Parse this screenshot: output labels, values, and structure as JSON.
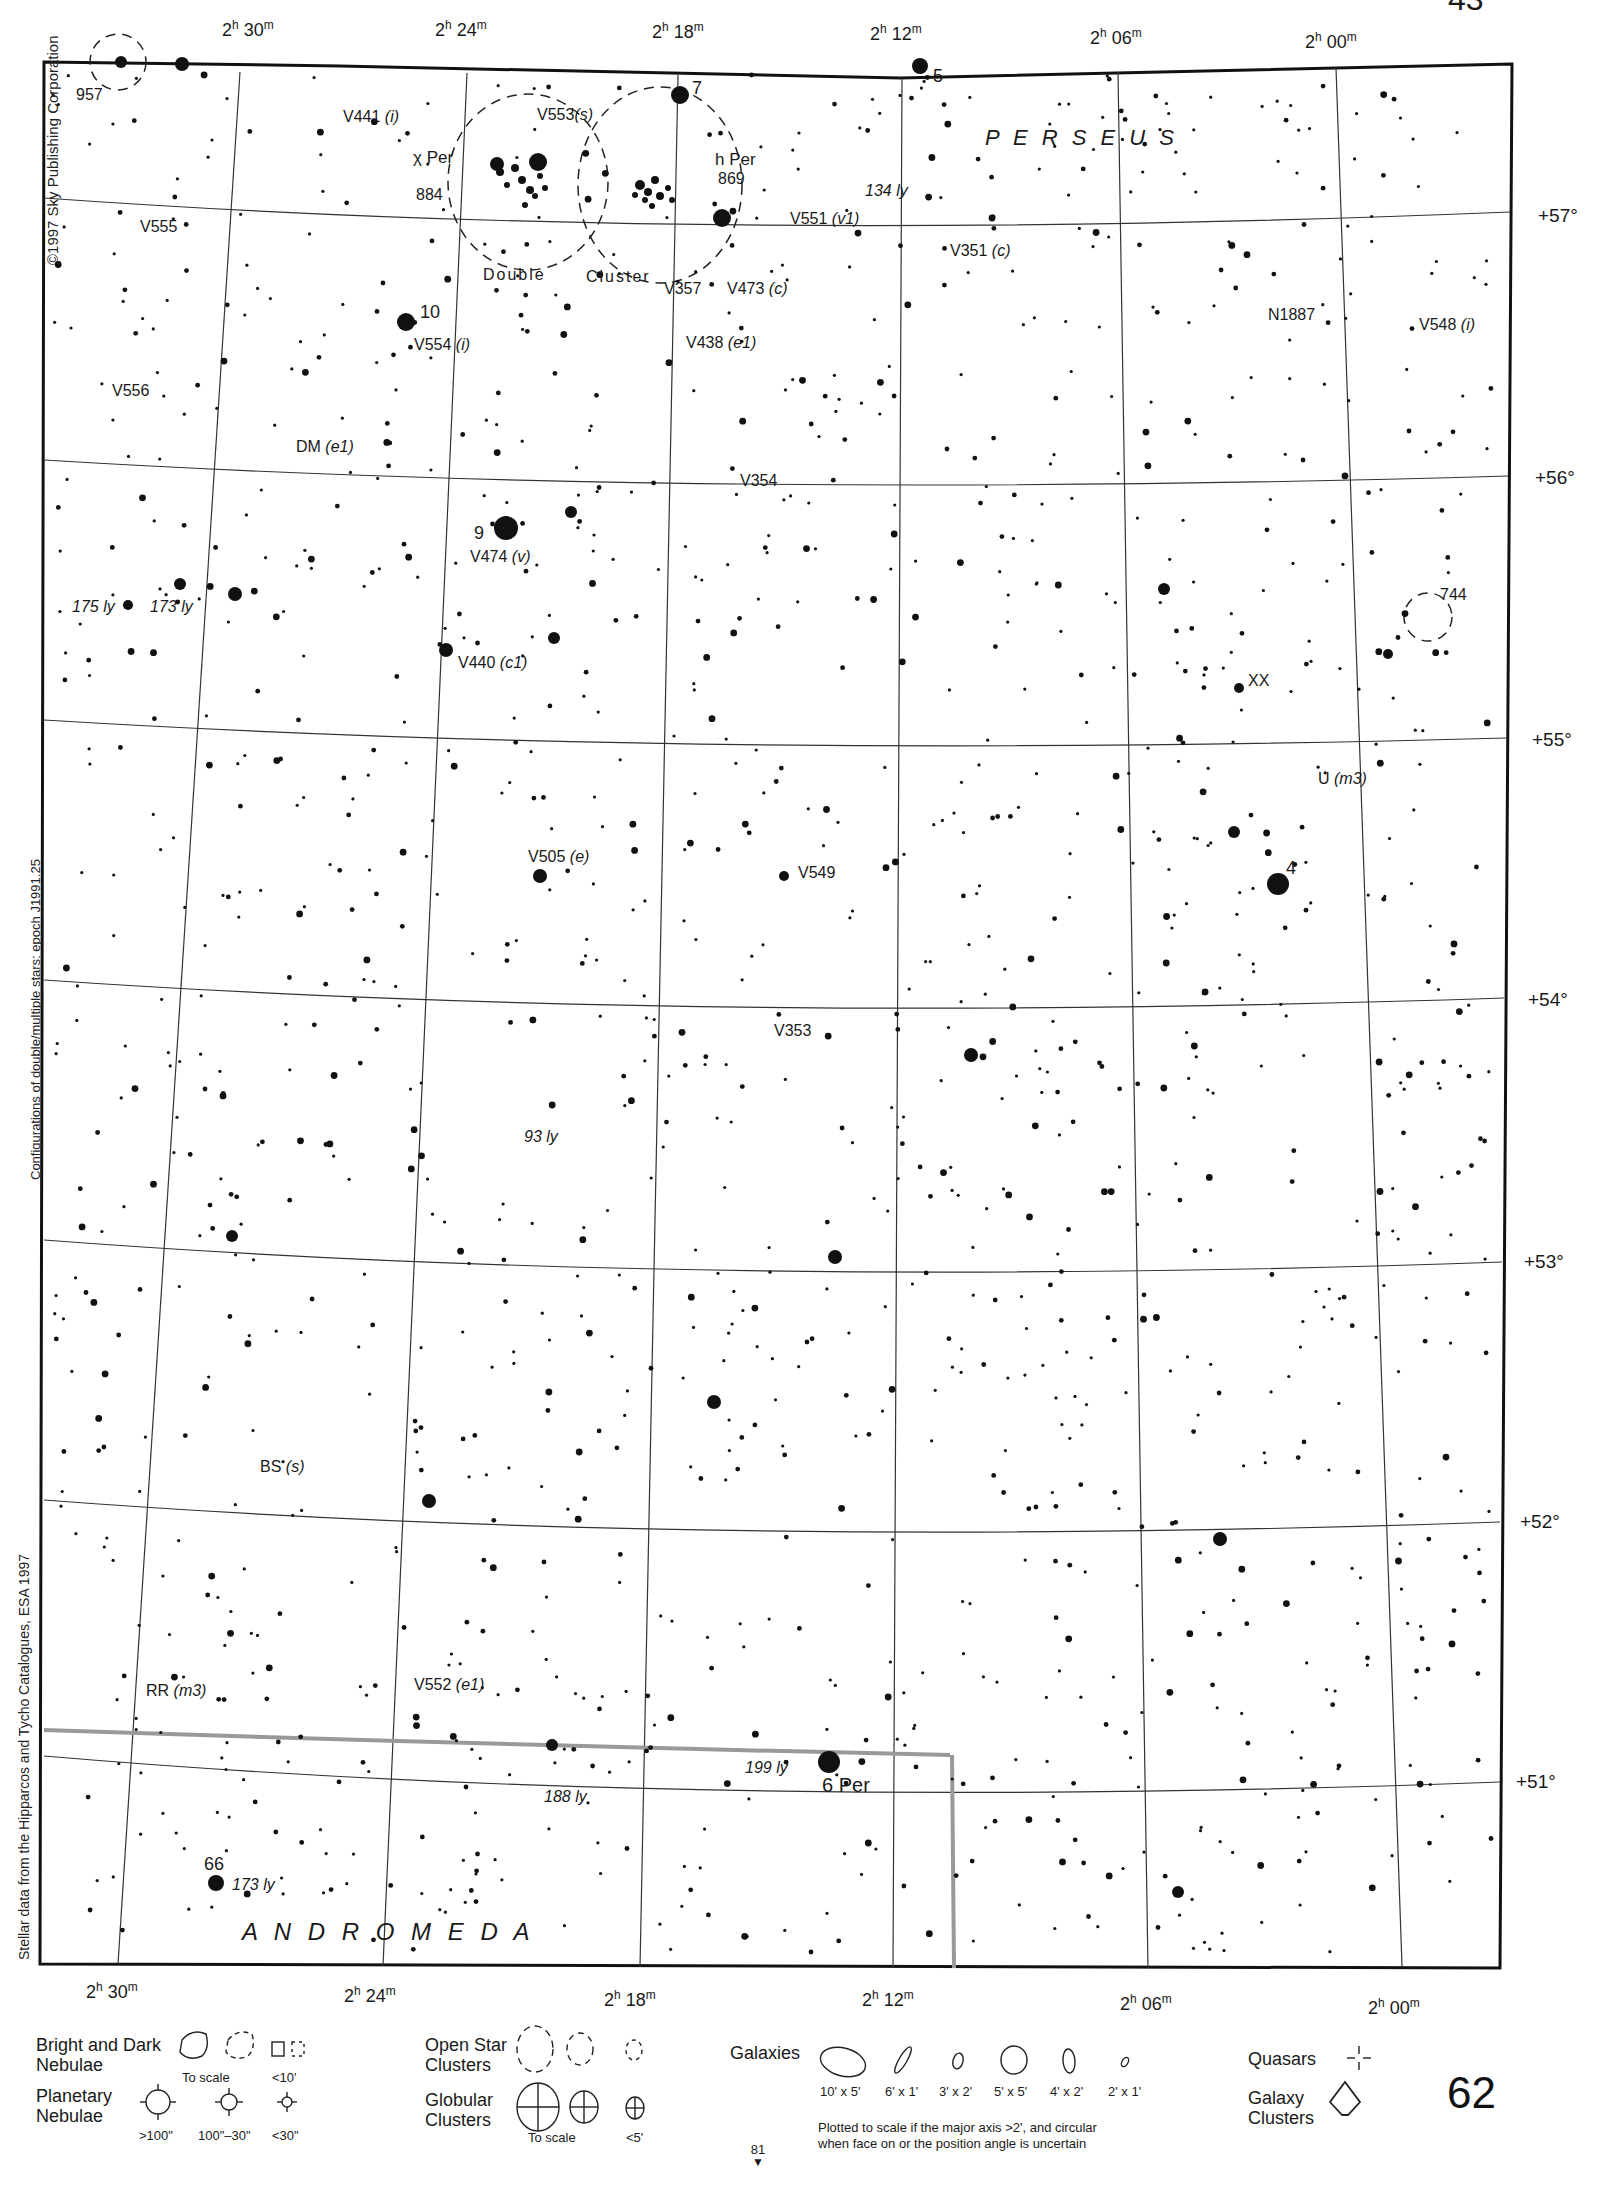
{
  "chart_title": "Sky Atlas Chart 62 — Perseus / Andromeda",
  "page": {
    "number": "62",
    "next_page_below": "81",
    "top_right_partial": "43"
  },
  "credits": {
    "copyright": "©1997 Sky Publishing Corporation",
    "epoch_note": "Configurations of double/multiple stars: epoch J1991.25",
    "data_source": "Stellar data from the Hipparcos and Tycho Catalogues, ESA 1997"
  },
  "axes": {
    "ra_top": [
      {
        "h": "2",
        "m": "30"
      },
      {
        "h": "2",
        "m": "24"
      },
      {
        "h": "2",
        "m": "18"
      },
      {
        "h": "2",
        "m": "12"
      },
      {
        "h": "2",
        "m": "06"
      },
      {
        "h": "2",
        "m": "00"
      }
    ],
    "ra_bottom": [
      {
        "h": "2",
        "m": "30"
      },
      {
        "h": "2",
        "m": "24"
      },
      {
        "h": "2",
        "m": "18"
      },
      {
        "h": "2",
        "m": "12"
      },
      {
        "h": "2",
        "m": "06"
      },
      {
        "h": "2",
        "m": "00"
      }
    ],
    "dec": [
      "+57°",
      "+56°",
      "+55°",
      "+54°",
      "+53°",
      "+52°",
      "+51°"
    ],
    "ra_unit_h": "h",
    "ra_unit_m": "m"
  },
  "constellations": [
    "P E R S E U S",
    "A N D R O M E D A"
  ],
  "labels": {
    "l957": "957",
    "l7": "7",
    "l5": "5",
    "v441": "V441",
    "v441_t": "(i)",
    "v553": "V553",
    "v553_t": "(s)",
    "chi_per": "χ Per",
    "n884": "884",
    "h_per": "h Per",
    "n869": "869",
    "double": "Double",
    "cluster": "Cluster",
    "ly134": "134 ly",
    "v551": "V551",
    "v551_t": "(v1)",
    "v351": "V351",
    "v351_t": "(c)",
    "v555": "V555",
    "l10": "10",
    "v554": "V554",
    "v554_t": "(i)",
    "v357": "V357",
    "v473": "V473",
    "v473_t": "(c)",
    "v438": "V438",
    "v438_t": "(e1)",
    "n1887": "N1887",
    "v548": "V548",
    "v548_t": "(i)",
    "v556": "V556",
    "dm": "DM",
    "dm_t": "(e1)",
    "v354": "V354",
    "l9": "9",
    "v474": "V474",
    "v474_t": "(v)",
    "ly175": "175 ly",
    "ly173a": "173 ly",
    "n744": "744",
    "v440": "V440",
    "v440_t": "(c1)",
    "xx": "XX",
    "u": "U",
    "u_t": "(m3)",
    "v505": "V505",
    "v505_t": "(e)",
    "v549": "V549",
    "l4": "4",
    "v353": "V353",
    "ly93": "93 ly",
    "bs": "BS",
    "bs_t": "(s)",
    "rr": "RR",
    "rr_t": "(m3)",
    "v552": "V552",
    "v552_t": "(e1)",
    "ly199": "199 ly",
    "six_per": "6 Per",
    "ly188": "188 ly",
    "l66": "66",
    "ly173b": "173 ly"
  },
  "legend": {
    "nebulae_label": "Bright and Dark Nebulae",
    "nebulae_scale": "To scale",
    "nebulae_small": "<10'",
    "planetary_label": "Planetary Nebulae",
    "planetary_sizes": [
      ">100\"",
      "100\"–30\"",
      "<30\""
    ],
    "open_label": "Open Star Clusters",
    "globular_label": "Globular Clusters",
    "globular_scale": "To scale",
    "globular_small": "<5'",
    "galaxies_label": "Galaxies",
    "galaxy_sizes": [
      "10' x 5'",
      "6' x 1'",
      "3' x 2'",
      "5' x 5'",
      "4' x 2'",
      "2' x 1'"
    ],
    "galaxy_note_1": "Plotted to scale if the major axis >2', and circular",
    "galaxy_note_2": "when face on or the position angle is uncertain",
    "quasars_label": "Quasars",
    "galaxy_clusters_label": "Galaxy Clusters"
  }
}
